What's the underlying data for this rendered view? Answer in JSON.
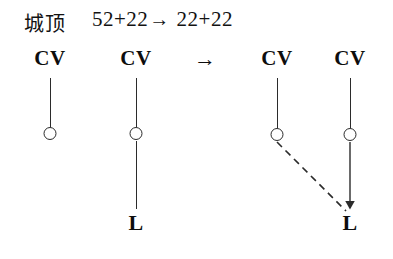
{
  "header": {
    "language_label": "城顶",
    "formula_left": "52+22",
    "formula_arrow": "→",
    "formula_right": "22+22",
    "formula_full": "52+22→ 22+22"
  },
  "diagram": {
    "transform_arrow": "→",
    "left_structure": {
      "trees": [
        {
          "root_label": "CV",
          "root_x": 50,
          "node_glyph": "circle",
          "node_x": 50,
          "node_y": 134,
          "leaf_label": null
        },
        {
          "root_label": "CV",
          "root_x": 136,
          "node_glyph": "circle",
          "node_x": 136,
          "node_y": 134,
          "leaf_label": "L",
          "leaf_x": 136,
          "leaf_y": 228
        }
      ]
    },
    "right_structure": {
      "trees": [
        {
          "root_label": "CV",
          "root_x": 277,
          "node_glyph": "circle",
          "node_x": 277,
          "node_y": 134,
          "leaf_label": null
        },
        {
          "root_label": "CV",
          "root_x": 350,
          "node_glyph": "circle",
          "node_x": 350,
          "node_y": 134,
          "leaf_label": "L",
          "leaf_x": 350,
          "leaf_y": 228
        }
      ],
      "association_line": {
        "style": "dashed",
        "from_x": 277,
        "from_y": 141,
        "to_x": 347,
        "to_y": 212
      },
      "spread_line": {
        "style": "solid-arrow",
        "from_x": 350,
        "from_y": 141,
        "to_x": 350,
        "to_y": 212
      }
    }
  },
  "colors": {
    "ink": "#1a1a1a",
    "stroke": "#2b2b2b",
    "background": "#ffffff"
  }
}
